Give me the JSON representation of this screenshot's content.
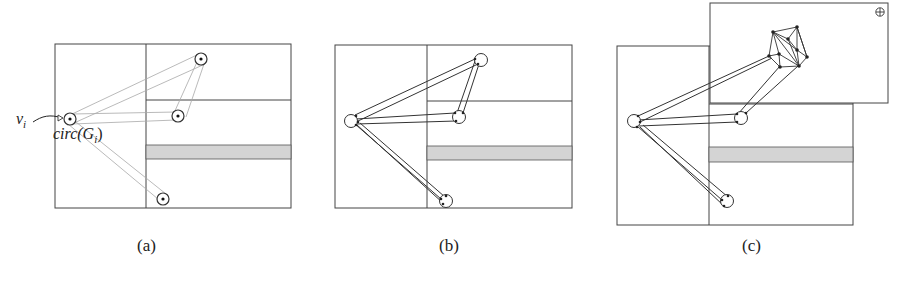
{
  "figure": {
    "panels": [
      {
        "id": "a",
        "caption": "(a)"
      },
      {
        "id": "b",
        "caption": "(b)"
      },
      {
        "id": "c",
        "caption": "(c)"
      }
    ],
    "labels": {
      "vertex": "v",
      "vertex_sub": "i",
      "circle": "circ(G",
      "circle_sub": "i",
      "circle_close": ")"
    },
    "overlay_icon": "circled-plus-icon",
    "colors": {
      "line": "#333333",
      "faint": "#9a9a9a",
      "band": "#d4d4d4"
    }
  }
}
